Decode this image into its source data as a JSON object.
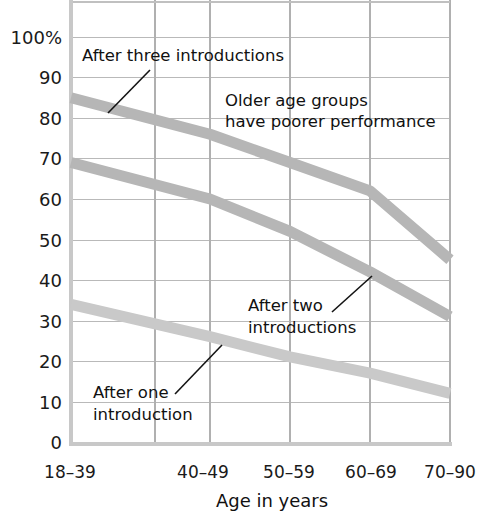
{
  "chart_data": {
    "type": "line",
    "title": "",
    "xlabel": "Age in years",
    "ylabel": "",
    "categories": [
      "18–39",
      "40–49",
      "50–59",
      "60–69",
      "70–90"
    ],
    "ylim": [
      0,
      100
    ],
    "yticks": [
      "0",
      "10",
      "20",
      "30",
      "40",
      "50",
      "60",
      "70",
      "80",
      "90",
      "100%"
    ],
    "ytick_values": [
      0,
      10,
      20,
      30,
      40,
      50,
      60,
      70,
      80,
      90,
      100
    ],
    "grid": true,
    "legend_position": "inline-annotations",
    "series": [
      {
        "name": "After three introductions",
        "color": "#b6b6b6",
        "values": [
          85,
          76,
          69,
          62,
          45
        ]
      },
      {
        "name": "After two introductions",
        "color": "#b6b6b6",
        "values": [
          69,
          60,
          52,
          42,
          31
        ]
      },
      {
        "name": "After one introduction",
        "color": "#c9c9c9",
        "values": [
          34,
          26,
          21,
          17,
          12
        ]
      }
    ],
    "annotations": [
      {
        "id": "after-three",
        "text": "After three introductions",
        "lines": [
          "After three introductions"
        ],
        "leader_from": [
          150,
          70
        ],
        "leader_to": [
          108,
          113
        ]
      },
      {
        "id": "older-age-groups",
        "text": "Older age groups have poorer performance",
        "lines": [
          "Older age groups",
          "have poorer performance"
        ],
        "leader_from": null,
        "leader_to": null
      },
      {
        "id": "after-two",
        "text": "After two introductions",
        "lines": [
          "After two",
          "introductions"
        ],
        "leader_from": [
          332,
          312
        ],
        "leader_to": [
          372,
          276
        ]
      },
      {
        "id": "after-one",
        "text": "After one introduction",
        "lines": [
          "After one",
          "introduction"
        ],
        "leader_from": [
          175,
          394
        ],
        "leader_to": [
          222,
          345
        ]
      }
    ]
  },
  "figure": {
    "xaxis_title": "Age in years"
  }
}
